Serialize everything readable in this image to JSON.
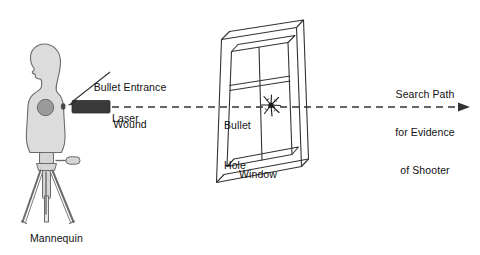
{
  "diagram": {
    "background_color": "#ffffff",
    "line_color": "#333333",
    "body_fill": "#dcdcdc",
    "body_stroke": "#6b6b6b",
    "wound_fill": "#9a9a9a",
    "laser_fill": "#3a3a3a",
    "tripod_fill": "#d5d5d5",
    "tripod_stroke": "#6b6b6b",
    "trajectory_color": "#333333"
  },
  "labels": {
    "bullet_entrance_wound": {
      "line1": "Bullet Entrance",
      "line2": "Wound"
    },
    "laser": "Laser",
    "mannequin": "Mannequin",
    "bullet_hole": {
      "line1": "Bullet",
      "line2": "Hole"
    },
    "window": "Window",
    "search_path": {
      "line1": "Search Path",
      "line2": "for Evidence",
      "line3": "of Shooter"
    }
  },
  "elements": {
    "mannequin_icon": "mannequin-silhouette-icon",
    "tripod_icon": "tripod-icon",
    "laser_icon": "laser-device-icon",
    "window_icon": "window-frame-icon",
    "bullet_hole_icon": "bullet-hole-starburst-icon",
    "trajectory_icon": "dashed-trajectory-arrow-icon",
    "leader_icon": "leader-line-arrow-icon"
  }
}
